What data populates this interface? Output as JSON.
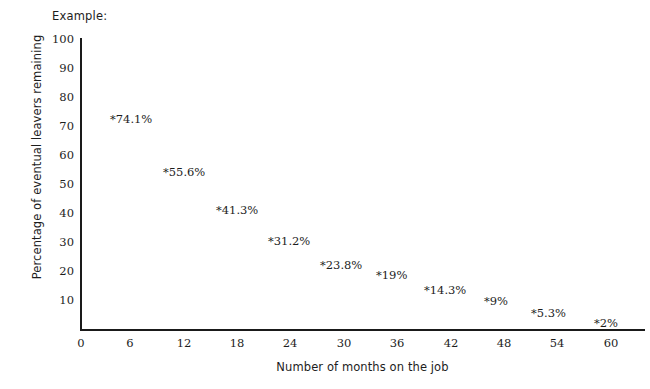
{
  "heading": {
    "text": "Example:"
  },
  "chart_data": {
    "type": "scatter",
    "title": "",
    "xlabel": "Number of months on the job",
    "ylabel": "Percentage of eventual leavers remaining",
    "xlim": [
      0,
      60
    ],
    "ylim": [
      0,
      100
    ],
    "xticks": [
      0,
      6,
      12,
      18,
      24,
      30,
      36,
      42,
      48,
      54,
      60
    ],
    "xtick_labels": [
      "0",
      "6",
      "12",
      "18",
      "24",
      "30",
      "36",
      "42",
      "48",
      "54",
      "60"
    ],
    "yticks": [
      10,
      20,
      30,
      40,
      50,
      60,
      70,
      80,
      90,
      100
    ],
    "ytick_labels": [
      "10",
      "20",
      "30",
      "40",
      "50",
      "60",
      "70",
      "80",
      "90",
      "100"
    ],
    "grid": false,
    "legend": "none",
    "marker": "*",
    "x": [
      3,
      9,
      15,
      21,
      27,
      33,
      39,
      45,
      51,
      57
    ],
    "y": [
      74.1,
      55.6,
      41.3,
      31.2,
      23.8,
      19,
      14.3,
      9,
      5.3,
      2
    ],
    "point_labels": [
      "*74.1%",
      "*55.6%",
      "*41.3%",
      "*31.2%",
      "*23.8%",
      "*19%",
      "*14.3%",
      "*9%",
      "*5.3%",
      "*2%"
    ],
    "points": [
      {
        "label": "*74.1%",
        "value": 74.1,
        "months": 3,
        "left": 110,
        "top": 114
      },
      {
        "label": "*55.6%",
        "value": 55.6,
        "months": 9,
        "left": 163,
        "top": 167
      },
      {
        "label": "*41.3%",
        "value": 41.3,
        "months": 15,
        "left": 216,
        "top": 205
      },
      {
        "label": "*31.2%",
        "value": 31.2,
        "months": 21,
        "left": 268,
        "top": 236
      },
      {
        "label": "*23.8%",
        "value": 23.8,
        "months": 27,
        "left": 320,
        "top": 260
      },
      {
        "label": "*19%",
        "value": 19,
        "months": 33,
        "left": 376,
        "top": 270
      },
      {
        "label": "*14.3%",
        "value": 14.3,
        "months": 39,
        "left": 424,
        "top": 285
      },
      {
        "label": "*9%",
        "value": 9,
        "months": 45,
        "left": 484,
        "top": 296
      },
      {
        "label": "*5.3%",
        "value": 5.3,
        "months": 51,
        "left": 531,
        "top": 308
      },
      {
        "label": "*2%",
        "value": 2,
        "months": 57,
        "left": 594,
        "top": 318
      }
    ]
  },
  "axis_geometry": {
    "y_ticks_px": [
      {
        "label": "100",
        "top": 38
      },
      {
        "label": "90",
        "top": 67
      },
      {
        "label": "80",
        "top": 96
      },
      {
        "label": "70",
        "top": 125
      },
      {
        "label": "60",
        "top": 154
      },
      {
        "label": "50",
        "top": 183
      },
      {
        "label": "40",
        "top": 212
      },
      {
        "label": "30",
        "top": 241
      },
      {
        "label": "20",
        "top": 270
      },
      {
        "label": "10",
        "top": 299
      }
    ],
    "x_ticks_px": [
      {
        "label": "0",
        "left": 81
      },
      {
        "label": "6",
        "left": 130
      },
      {
        "label": "12",
        "left": 184
      },
      {
        "label": "18",
        "left": 237
      },
      {
        "label": "24",
        "left": 290
      },
      {
        "label": "30",
        "left": 344
      },
      {
        "label": "36",
        "left": 397
      },
      {
        "label": "42",
        "left": 451
      },
      {
        "label": "48",
        "left": 504
      },
      {
        "label": "54",
        "left": 557
      },
      {
        "label": "60",
        "left": 611
      }
    ]
  },
  "colors": {
    "axis": "#1a1a1a",
    "text": "#1d1d1d",
    "background": "#ffffff"
  }
}
